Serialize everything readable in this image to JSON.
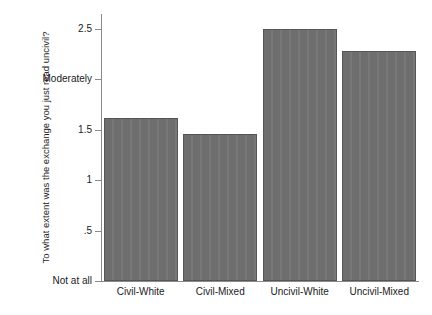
{
  "chart_data": {
    "type": "bar",
    "title": "",
    "xlabel": "",
    "ylabel": "To what extent was the exchange you just read uncivil?",
    "categories": [
      "Civil-White",
      "Civil-Mixed",
      "Uncivil-White",
      "Uncivil-Mixed"
    ],
    "values": [
      1.62,
      1.46,
      2.5,
      2.28
    ],
    "ylim": [
      0,
      2.65
    ],
    "grid": false,
    "legend": "none",
    "bar_color": "#6e6e6e",
    "yticks": [
      {
        "value": 2.5,
        "label": "2.5"
      },
      {
        "value": 2.0,
        "label": "Moderately"
      },
      {
        "value": 1.5,
        "label": "1.5"
      },
      {
        "value": 1.0,
        "label": "1"
      },
      {
        "value": 0.5,
        "label": ".5"
      },
      {
        "value": 0.0,
        "label": "Not at all"
      }
    ]
  },
  "axis": {
    "y_title": "To what extent was the exchange you just read uncivil?"
  }
}
